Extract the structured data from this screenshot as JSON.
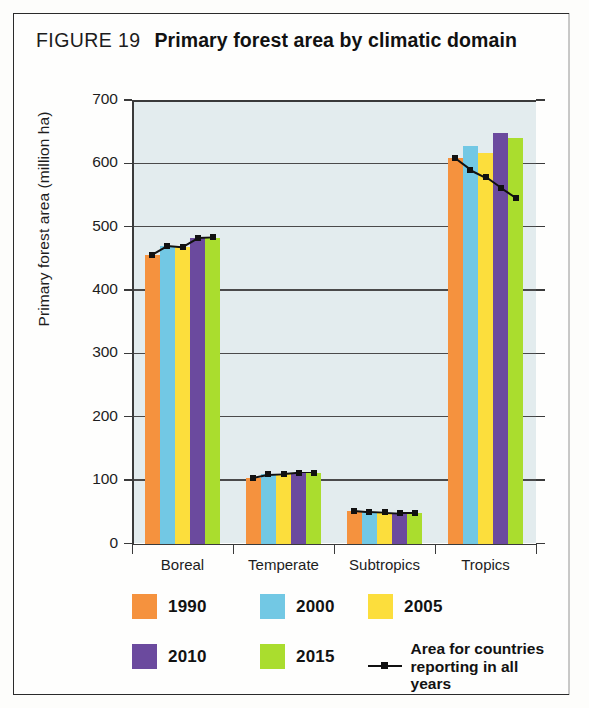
{
  "figure": {
    "number_label": "FIGURE 19",
    "title": "Primary forest area by climatic domain"
  },
  "legend": {
    "entries": [
      {
        "label": "1990",
        "color": "#F5923E"
      },
      {
        "label": "2000",
        "color": "#72C8E4"
      },
      {
        "label": "2005",
        "color": "#FCDE3C"
      },
      {
        "label": "2010",
        "color": "#6B4A9E"
      },
      {
        "label": "2015",
        "color": "#AADD2E"
      }
    ],
    "line_entry": {
      "line1": "Area for countries",
      "line2": "reporting in all years",
      "color": "#111111"
    }
  },
  "chart_data": {
    "type": "bar",
    "title": "Primary forest area by climatic domain",
    "xlabel": "",
    "ylabel": "Primary forest area (million ha)",
    "categories": [
      "Boreal",
      "Temperate",
      "Subtropics",
      "Tropics"
    ],
    "ylim": [
      0,
      700
    ],
    "yticks": [
      0,
      100,
      200,
      300,
      400,
      500,
      600,
      700
    ],
    "grid": true,
    "legend_position": "below",
    "series": [
      {
        "name": "1990",
        "color": "#F5923E",
        "values": [
          456,
          104,
          52,
          608
        ]
      },
      {
        "name": "2000",
        "color": "#72C8E4",
        "values": [
          470,
          109,
          49,
          627
        ]
      },
      {
        "name": "2005",
        "color": "#FCDE3C",
        "values": [
          468,
          110,
          48,
          617
        ]
      },
      {
        "name": "2010",
        "color": "#6B4A9E",
        "values": [
          482,
          112,
          48,
          648
        ]
      },
      {
        "name": "2015",
        "color": "#AADD2E",
        "values": [
          483,
          112,
          48,
          640
        ]
      }
    ],
    "overlay_line": {
      "name": "Area for countries reporting in all years",
      "color": "#111111",
      "values": [
        [
          456,
          470,
          468,
          482,
          483
        ],
        [
          104,
          109,
          110,
          112,
          112
        ],
        [
          52,
          50,
          49,
          48,
          48
        ],
        [
          608,
          590,
          578,
          561,
          545
        ]
      ]
    }
  }
}
